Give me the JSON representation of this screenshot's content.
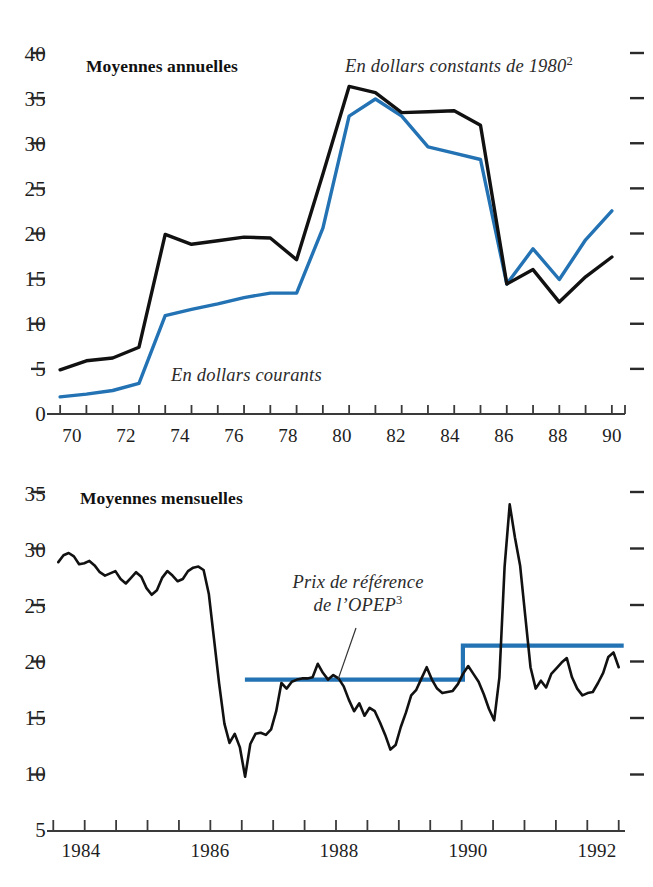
{
  "figure": {
    "background": "#ffffff",
    "line_colors": {
      "constant_dollars": "#111111",
      "current_dollars": "#2272B4",
      "opec_reference": "#2272B4",
      "axis": "#3a3a3a"
    }
  },
  "panels": {
    "annual": {
      "title": "Moyennes annuelles",
      "label_constant": "En dollars constants de 1980",
      "label_constant_sup": "2",
      "label_current": "En dollars courants"
    },
    "monthly": {
      "title": "Moyennes mensuelles",
      "label_opec_line1": "Prix de référence",
      "label_opec_line2": "de l’OPEP",
      "label_opec_sup": "3"
    }
  },
  "chart_data": [
    {
      "id": "annual-averages",
      "type": "line",
      "title": "Moyennes annuelles",
      "xlabel": "",
      "ylabel": "",
      "xlim": [
        69.5,
        91.5
      ],
      "ylim": [
        0,
        40
      ],
      "yticks": [
        0,
        5,
        10,
        15,
        20,
        25,
        30,
        35,
        40
      ],
      "ytick_labels": [
        "0",
        "5",
        "10",
        "15",
        "20",
        "25",
        "30",
        "35",
        "40"
      ],
      "xticks": [
        70,
        71,
        72,
        73,
        74,
        75,
        76,
        77,
        78,
        79,
        80,
        81,
        82,
        83,
        84,
        85,
        86,
        87,
        88,
        89,
        90,
        91
      ],
      "xtick_labels": [
        "70",
        "",
        "72",
        "",
        "74",
        "",
        "76",
        "",
        "78",
        "",
        "80",
        "",
        "82",
        "",
        "84",
        "",
        "86",
        "",
        "88",
        "",
        "90",
        ""
      ],
      "grid": false,
      "legend": "inline-annotations",
      "x": [
        70,
        71,
        72,
        73,
        74,
        75,
        76,
        77,
        78,
        79,
        80,
        81,
        82,
        83,
        84,
        85,
        86,
        87,
        88,
        89,
        90,
        91
      ],
      "series": [
        {
          "name": "En dollars constants de 1980",
          "color": "#111111",
          "values": [
            4.9,
            5.9,
            6.2,
            7.4,
            19.9,
            18.8,
            19.2,
            19.6,
            19.5,
            17.1,
            26.6,
            36.3,
            35.6,
            33.4,
            33.5,
            33.6,
            32.0,
            14.4,
            16.0,
            12.4,
            15.2,
            17.4,
            14.7
          ]
        },
        {
          "name": "En dollars courants",
          "color": "#2272B4",
          "values": [
            1.6,
            1.9,
            2.2,
            2.6,
            3.4,
            10.9,
            11.6,
            12.2,
            12.9,
            13.4,
            13.4,
            20.6,
            33.0,
            34.9,
            33.0,
            29.6,
            28.9,
            28.2,
            14.4,
            18.3,
            14.9,
            19.3,
            22.5,
            19.2
          ]
        }
      ],
      "annotations": [
        {
          "text": "Moyennes annuelles",
          "style": "bold",
          "x": 71.0,
          "y": 39.0
        },
        {
          "text": "En dollars constants de 1980²",
          "style": "italic",
          "x": 80.5,
          "y": 39.0
        },
        {
          "text": "En dollars courants",
          "style": "italic",
          "x": 75.5,
          "y": 8.6
        }
      ]
    },
    {
      "id": "monthly-averages",
      "type": "line",
      "title": "Moyennes mensuelles",
      "xlabel": "",
      "ylabel": "",
      "xlim": [
        1983.4,
        1992.6
      ],
      "ylim": [
        5,
        35
      ],
      "yticks": [
        5,
        10,
        15,
        20,
        25,
        30,
        35
      ],
      "ytick_labels": [
        "5",
        "10",
        "15",
        "20",
        "25",
        "30",
        "35"
      ],
      "xticks": [
        1983.5,
        1984.0,
        1984.5,
        1985.0,
        1985.5,
        1986.0,
        1986.5,
        1987.0,
        1987.5,
        1988.0,
        1988.5,
        1989.0,
        1989.5,
        1990.0,
        1990.5,
        1991.0,
        1991.5,
        1992.0,
        1992.5
      ],
      "xtick_labels": [
        "1984",
        "1986",
        "1988",
        "1990",
        "1992"
      ],
      "grid": false,
      "legend": "inline-annotations",
      "series": [
        {
          "name": "Prix au comptant mensuel",
          "color": "#111111",
          "values": [
            28.8,
            29.4,
            29.6,
            29.3,
            28.6,
            28.7,
            28.9,
            28.5,
            27.9,
            27.6,
            27.8,
            28.0,
            27.3,
            26.9,
            27.4,
            27.9,
            27.5,
            26.5,
            25.9,
            26.3,
            27.4,
            28.0,
            27.6,
            27.1,
            27.3,
            28.0,
            28.3,
            28.4,
            28.1,
            26.0,
            22.0,
            18.0,
            14.5,
            12.8,
            13.6,
            12.4,
            9.8,
            12.7,
            13.6,
            13.7,
            13.5,
            14.0,
            15.6,
            18.1,
            17.6,
            18.2,
            18.4,
            18.5,
            18.5,
            18.6,
            19.8,
            19.0,
            18.4,
            18.8,
            18.5,
            17.8,
            16.6,
            15.6,
            16.3,
            15.2,
            15.9,
            15.6,
            14.6,
            13.5,
            12.2,
            12.6,
            14.2,
            15.5,
            17.0,
            17.5,
            18.5,
            19.5,
            18.4,
            17.6,
            17.2,
            17.3,
            17.4,
            18.0,
            18.9,
            19.6,
            18.9,
            18.2,
            17.1,
            15.8,
            14.8,
            18.6,
            28.4,
            33.9,
            31.0,
            28.5,
            24.0,
            19.5,
            17.6,
            18.3,
            17.7,
            18.9,
            19.4,
            19.9,
            20.3,
            18.6,
            17.6,
            17.0,
            17.2,
            17.3,
            18.1,
            19.0,
            20.4,
            20.8,
            19.5
          ]
        },
        {
          "name": "Prix de référence de l’OPEP",
          "color": "#2272B4",
          "type": "step",
          "points": [
            {
              "x": 1986.55,
              "y": 18.4
            },
            {
              "x": 1990.02,
              "y": 18.4
            },
            {
              "x": 1990.02,
              "y": 21.4
            },
            {
              "x": 1992.58,
              "y": 21.4
            }
          ]
        }
      ],
      "annotations": [
        {
          "text": "Moyennes mensuelles",
          "style": "bold",
          "x": 1984.1,
          "y": 34.0
        },
        {
          "text": "Prix de référence de l’OPEP³",
          "style": "italic",
          "x": 1988.0,
          "y": 25.5
        }
      ]
    }
  ]
}
